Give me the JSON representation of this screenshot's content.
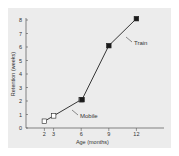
{
  "chart_data": {
    "type": "line",
    "title": "",
    "xlabel": "Age (months)",
    "ylabel": "Retention (weeks)",
    "xlim": [
      0,
      15
    ],
    "ylim": [
      0,
      8
    ],
    "x_ticks": [
      2,
      3,
      6,
      9,
      12
    ],
    "y_ticks": [
      0,
      1,
      2,
      3,
      4,
      5,
      6,
      7,
      8
    ],
    "grid": false,
    "legend": "none",
    "series": [
      {
        "name": "Mobile",
        "marker": "open-square",
        "points": [
          {
            "x": 2,
            "y": 0.5
          },
          {
            "x": 3,
            "y": 0.9
          },
          {
            "x": 6,
            "y": 2.1
          }
        ]
      },
      {
        "name": "Train",
        "marker": "filled-square",
        "points": [
          {
            "x": 6,
            "y": 2.1
          },
          {
            "x": 9,
            "y": 6.1
          },
          {
            "x": 12,
            "y": 8.1
          }
        ]
      }
    ],
    "annotations": [
      {
        "text": "Mobile",
        "series": "Mobile"
      },
      {
        "text": "Train",
        "series": "Train"
      }
    ]
  },
  "colors": {
    "background": "#ececec",
    "axis": "#555555",
    "line": "#222222",
    "marker_fill_open": "#ffffff",
    "marker_fill_filled": "#1a1a1a"
  }
}
